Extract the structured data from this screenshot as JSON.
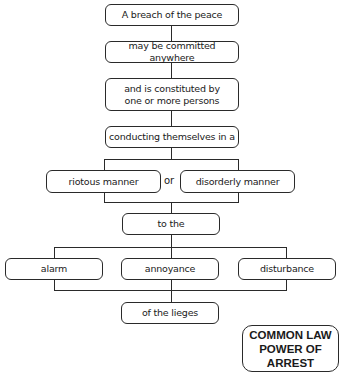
{
  "diagram": {
    "nodes": {
      "breach": "A breach of the peace",
      "anywhere": "may be committed anywhere",
      "constituted": "and is constituted by\none or more persons",
      "conducting": "conducting themselves in a",
      "riotous": "riotous manner",
      "or": "or",
      "disorderly": "disorderly manner",
      "to_the": "to the",
      "alarm": "alarm",
      "annoyance": "annoyance",
      "disturbance": "disturbance",
      "lieges": "of the lieges",
      "power": "COMMON LAW\nPOWER OF\nARREST"
    },
    "edges": [
      [
        "breach",
        "anywhere"
      ],
      [
        "anywhere",
        "constituted"
      ],
      [
        "constituted",
        "conducting"
      ],
      [
        "conducting",
        "riotous"
      ],
      [
        "conducting",
        "disorderly"
      ],
      [
        "riotous",
        "to_the"
      ],
      [
        "disorderly",
        "to_the"
      ],
      [
        "to_the",
        "alarm"
      ],
      [
        "to_the",
        "annoyance"
      ],
      [
        "to_the",
        "disturbance"
      ],
      [
        "alarm",
        "lieges"
      ],
      [
        "annoyance",
        "lieges"
      ],
      [
        "disturbance",
        "lieges"
      ]
    ]
  }
}
